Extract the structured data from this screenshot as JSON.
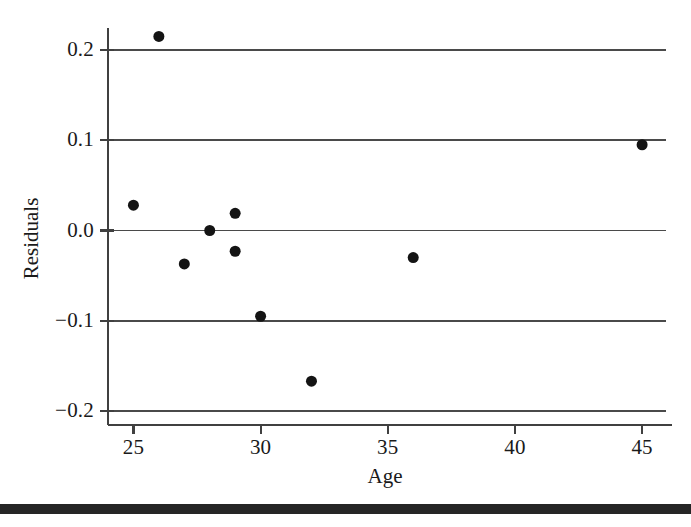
{
  "chart_data": {
    "type": "scatter",
    "title": "",
    "xlabel": "Age",
    "ylabel": "Residuals",
    "xlim": [
      24.0,
      45.9
    ],
    "ylim": [
      -0.215,
      0.235
    ],
    "xticks": [
      25,
      30,
      35,
      40,
      45
    ],
    "xticklabels": [
      "25",
      "30",
      "35",
      "40",
      "45"
    ],
    "yticks": [
      0.2,
      0.1,
      0.0,
      -0.1,
      -0.2
    ],
    "yticklabels": [
      "0.2",
      "0.1",
      "0.0",
      "-0.1",
      "-0.2"
    ],
    "grid": "horizontal-only",
    "gridlines_y": [
      0.2,
      0.1,
      0.0,
      -0.1,
      -0.2
    ],
    "legend": "none",
    "marker": {
      "shape": "circle",
      "color": "#141414",
      "size_px": 11,
      "filled": true
    },
    "points": [
      {
        "x": 25,
        "y": 0.028
      },
      {
        "x": 26,
        "y": 0.215
      },
      {
        "x": 27,
        "y": -0.037
      },
      {
        "x": 28,
        "y": 0.0
      },
      {
        "x": 29,
        "y": 0.019
      },
      {
        "x": 29,
        "y": -0.023
      },
      {
        "x": 30,
        "y": -0.095
      },
      {
        "x": 32,
        "y": -0.167
      },
      {
        "x": 36,
        "y": -0.03
      },
      {
        "x": 45,
        "y": 0.095
      }
    ],
    "n_points": 10,
    "axis_color": "#404040",
    "grid_color": "#4a4a4a",
    "background_color": "#ffffff"
  },
  "figure": {
    "bottom_bar_color": "#262626"
  }
}
